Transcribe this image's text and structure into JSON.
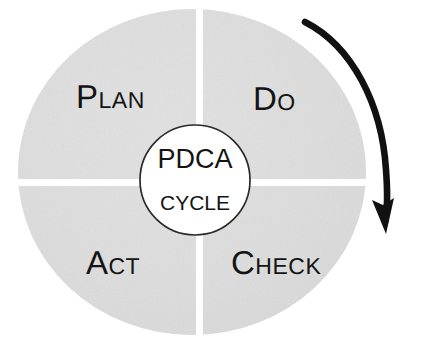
{
  "diagram": {
    "type": "cycle-wheel",
    "title": "PDCA Cycle",
    "hub": {
      "primary_label": "PDCA",
      "secondary_label": "CYCLE"
    },
    "quadrants": [
      {
        "id": "plan",
        "label": "Plan",
        "position": "top-left"
      },
      {
        "id": "do",
        "label": "Do",
        "position": "top-right"
      },
      {
        "id": "act",
        "label": "Act",
        "position": "bottom-left"
      },
      {
        "id": "check",
        "label": "Check",
        "position": "bottom-right"
      }
    ],
    "arrow": {
      "name": "clockwise-rotation-arrow",
      "direction": "clockwise",
      "color": "#111111"
    },
    "colors": {
      "wheel_fill": "#dedede",
      "wheel_fill_light": "#e6e6e6",
      "divider": "#ffffff",
      "hub_fill": "#ffffff",
      "hub_stroke": "#2a2a2a",
      "text": "#141414",
      "background": "#ffffff"
    }
  }
}
